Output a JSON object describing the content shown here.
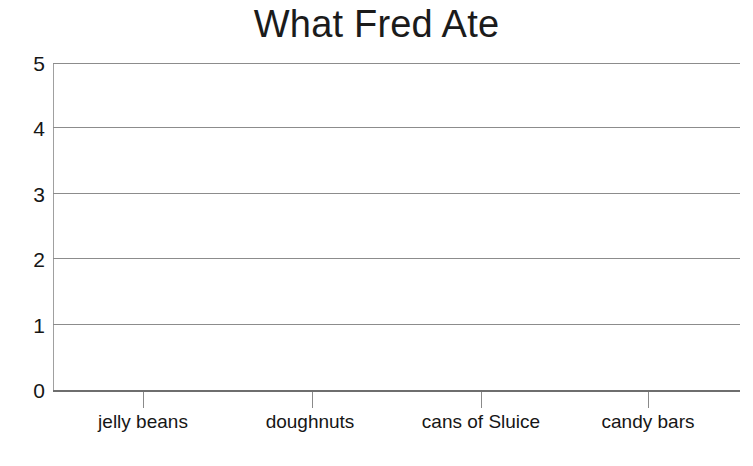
{
  "chart_data": {
    "type": "bar",
    "title": "What Fred Ate",
    "xlabel": "",
    "ylabel": "",
    "categories": [
      "jelly beans",
      "doughnuts",
      "cans of Sluice",
      "candy bars"
    ],
    "values": [
      null,
      null,
      null,
      null
    ],
    "ylim": [
      0,
      5
    ],
    "y_ticks": [
      "0",
      "1",
      "2",
      "3",
      "4",
      "5"
    ],
    "grid": true,
    "grid_axis": "y",
    "legend": null,
    "legend_position": "none",
    "annotations": [],
    "note": "Blank grid template — no bars are drawn; the plotting area is empty."
  },
  "style": {
    "background_color": "#ffffff",
    "text_color": "#161616",
    "title_color": "#1b1b1b",
    "gridline_color": "#8c8c8c",
    "axis_color": "#6e6e6e"
  }
}
